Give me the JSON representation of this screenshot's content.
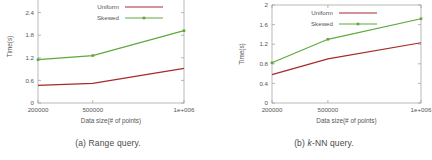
{
  "figure": {
    "panels": [
      {
        "id": "a",
        "caption_prefix": "(a)",
        "caption_text": "Range query.",
        "caption_full": "(a) Range query.",
        "chart_data": {
          "type": "line",
          "title": "",
          "xlabel": "Data size(# of points)",
          "ylabel": "Time(s)",
          "categories": [
            "200000",
            "500000",
            "1e+006"
          ],
          "x": [
            200000,
            500000,
            1000000
          ],
          "xlim": [
            200000,
            1000000
          ],
          "ylim": [
            0,
            3
          ],
          "yticks": [
            0,
            0.6,
            1.2,
            1.8,
            2.4,
            3
          ],
          "ytick_labels": [
            "0",
            "0.6",
            "1.2",
            "1.8",
            "2.4",
            "3"
          ],
          "xticks": [
            200000,
            500000,
            1000000
          ],
          "xtick_labels": [
            "200000",
            "500000",
            "1e+006"
          ],
          "grid": false,
          "legend_position": "top-center",
          "series": [
            {
              "name": "Uniform",
              "color": "#a52a2a",
              "values": [
                0.47,
                0.52,
                0.92
              ]
            },
            {
              "name": "Skewed",
              "color": "#5ea83c",
              "values": [
                1.15,
                1.26,
                1.92
              ]
            }
          ]
        }
      },
      {
        "id": "b",
        "caption_prefix": "(b)",
        "caption_text": "NN query.",
        "caption_italic": "k",
        "caption_full": "(b) k-NN query.",
        "chart_data": {
          "type": "line",
          "title": "",
          "xlabel": "Data size(# of points)",
          "ylabel": "Time(s)",
          "categories": [
            "200000",
            "500000",
            "1e+006"
          ],
          "x": [
            200000,
            500000,
            1000000
          ],
          "xlim": [
            200000,
            1000000
          ],
          "ylim": [
            0,
            2
          ],
          "yticks": [
            0,
            0.4,
            0.8,
            1.2,
            1.6,
            2
          ],
          "ytick_labels": [
            "0",
            "0.4",
            "0.8",
            "1.2",
            "1.6",
            "2"
          ],
          "xticks": [
            200000,
            500000,
            1000000
          ],
          "xtick_labels": [
            "200000",
            "500000",
            "1e+006"
          ],
          "grid": false,
          "legend_position": "top-center",
          "series": [
            {
              "name": "Uniform",
              "color": "#a52a2a",
              "values": [
                0.58,
                0.9,
                1.23
              ]
            },
            {
              "name": "Skewed",
              "color": "#5ea83c",
              "values": [
                0.82,
                1.3,
                1.72
              ]
            }
          ]
        }
      }
    ]
  },
  "colors": {
    "uniform": "#a52a2a",
    "skewed": "#5ea83c",
    "axis": "#9b9b9b",
    "text": "#555555",
    "background": "#ffffff"
  }
}
